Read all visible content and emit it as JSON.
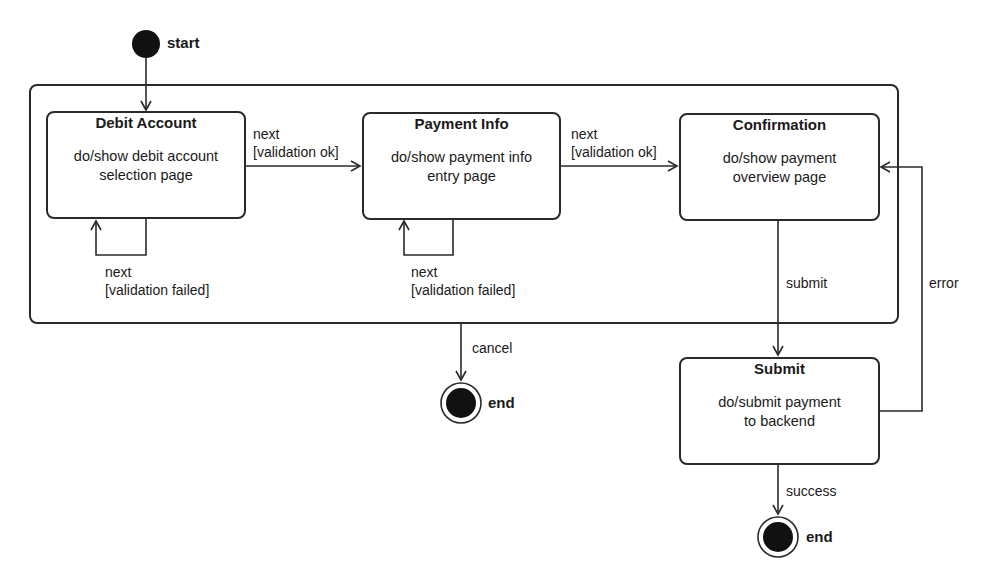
{
  "diagram": {
    "type": "uml-state-machine",
    "pseudostates": {
      "start": {
        "label": "start"
      },
      "end_cancel": {
        "label": "end"
      },
      "end_success": {
        "label": "end"
      }
    },
    "states": [
      {
        "id": "debit_account",
        "title": "Debit Account",
        "activity_line1": "do/show debit account",
        "activity_line2": "selection page"
      },
      {
        "id": "payment_info",
        "title": "Payment Info",
        "activity_line1": "do/show payment info",
        "activity_line2": "entry page"
      },
      {
        "id": "confirmation",
        "title": "Confirmation",
        "activity_line1": "do/show payment",
        "activity_line2": "overview page"
      },
      {
        "id": "submit",
        "title": "Submit",
        "activity_line1": "do/submit payment",
        "activity_line2": "to backend"
      }
    ],
    "transitions": [
      {
        "id": "t_debit_payment",
        "event": "next",
        "guard": "[validation ok]"
      },
      {
        "id": "t_payment_confirm",
        "event": "next",
        "guard": "[validation ok]"
      },
      {
        "id": "t_debit_self",
        "event": "next",
        "guard": "[validation failed]"
      },
      {
        "id": "t_payment_self",
        "event": "next",
        "guard": "[validation failed]"
      },
      {
        "id": "t_cancel",
        "event": "cancel"
      },
      {
        "id": "t_submit",
        "event": "submit"
      },
      {
        "id": "t_error",
        "event": "error"
      },
      {
        "id": "t_success",
        "event": "success"
      }
    ]
  }
}
